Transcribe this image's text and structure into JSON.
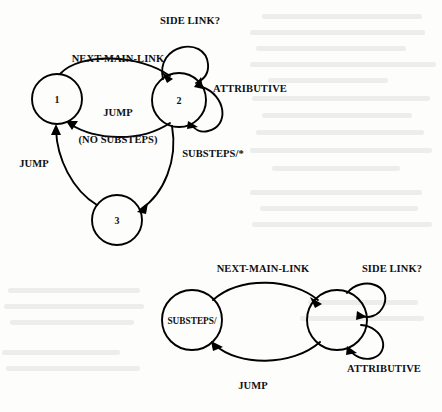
{
  "document": {
    "kind": "scanned-figure",
    "background_color": "#fdfdfc",
    "ink_color": "#000000"
  },
  "diagrams": [
    {
      "id": "upper-automaton",
      "nodes": [
        {
          "id": "n1",
          "label": "1",
          "cx": 57,
          "cy": 99,
          "r": 25
        },
        {
          "id": "n2",
          "label": "2",
          "cx": 179,
          "cy": 100,
          "r": 27
        },
        {
          "id": "n3",
          "label": "3",
          "cx": 117,
          "cy": 220,
          "r": 25
        }
      ],
      "edges": [
        {
          "id": "e1",
          "from": "n1",
          "to": "n2",
          "label": "NEXT-MAIN-LINK",
          "label_x": 118,
          "label_y": 62,
          "kind": "arc"
        },
        {
          "id": "e2",
          "from": "n2",
          "to": "n1",
          "label": "JUMP",
          "label_x": 118,
          "label_y": 116,
          "kind": "arc"
        },
        {
          "id": "e3",
          "from": "n2",
          "to": "n1",
          "label": "(NO SUBSTEPS)",
          "label_x": 118,
          "label_y": 143,
          "kind": "annotation"
        },
        {
          "id": "e4",
          "from": "n2",
          "to": "n2",
          "label": "SIDE LINK?",
          "label_x": 190,
          "label_y": 24,
          "kind": "self-loop-top"
        },
        {
          "id": "e5",
          "from": "n2",
          "to": "n2",
          "label": "ATTRIBUTIVE",
          "label_x": 250,
          "label_y": 92,
          "kind": "self-loop-right"
        },
        {
          "id": "e6",
          "from": "n2",
          "to": "n3",
          "label": "SUBSTEPS/*",
          "label_x": 213,
          "label_y": 157,
          "kind": "arc"
        },
        {
          "id": "e7",
          "from": "n3",
          "to": "n1",
          "label": "JUMP",
          "label_x": 34,
          "label_y": 167,
          "kind": "arc"
        }
      ]
    },
    {
      "id": "lower-automaton",
      "nodes": [
        {
          "id": "m1",
          "label": "SUBSTEPS/",
          "cx": 192,
          "cy": 320,
          "r": 30
        },
        {
          "id": "m2",
          "label": "",
          "cx": 337,
          "cy": 320,
          "r": 30
        }
      ],
      "edges": [
        {
          "id": "f1",
          "from": "m1",
          "to": "m2",
          "label": "NEXT-MAIN-LINK",
          "label_x": 263,
          "label_y": 272,
          "kind": "arc"
        },
        {
          "id": "f2",
          "from": "m2",
          "to": "m1",
          "label": "JUMP",
          "label_x": 253,
          "label_y": 389,
          "kind": "arc"
        },
        {
          "id": "f3",
          "from": "m2",
          "to": "m2",
          "label": "SIDE LINK?",
          "label_x": 392,
          "label_y": 272,
          "kind": "self-loop-upper-right"
        },
        {
          "id": "f4",
          "from": "m2",
          "to": "m2",
          "label": "ATTRIBUTIVE",
          "label_x": 384,
          "label_y": 372,
          "kind": "self-loop-lower-right"
        }
      ]
    }
  ]
}
